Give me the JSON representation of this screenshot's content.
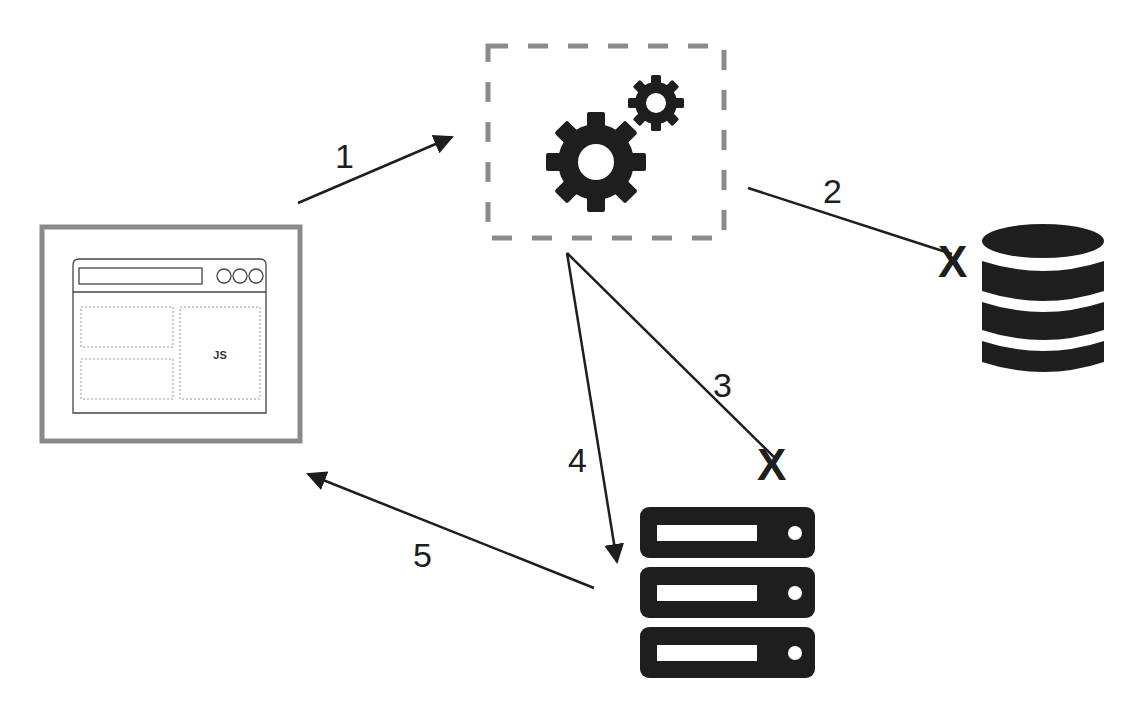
{
  "diagram": {
    "nodes": {
      "client": {
        "kind": "browser-window",
        "content_label": "JS"
      },
      "processor": {
        "kind": "gears-in-dashed-box"
      },
      "database": {
        "kind": "database-cylinder",
        "blocked": true
      },
      "server": {
        "kind": "server-stack",
        "units": 3
      }
    },
    "edges": [
      {
        "label": "1",
        "from": "client",
        "to": "processor",
        "arrow": true,
        "blocked": false
      },
      {
        "label": "2",
        "from": "processor",
        "to": "database",
        "arrow": false,
        "blocked": true
      },
      {
        "label": "3",
        "from": "processor",
        "to": "server",
        "arrow": false,
        "blocked": true
      },
      {
        "label": "4",
        "from": "processor",
        "to": "server",
        "arrow": true,
        "blocked": false
      },
      {
        "label": "5",
        "from": "server",
        "to": "client",
        "arrow": true,
        "blocked": false
      }
    ],
    "blocked_marker": "X",
    "colors": {
      "ink": "#1e1e1e",
      "frame": "#8a8a8a",
      "dash": "#8c8c8c",
      "background": "#ffffff"
    }
  }
}
